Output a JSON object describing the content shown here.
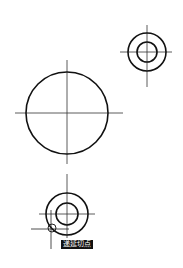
{
  "canvas": {
    "width": 183,
    "height": 268,
    "background": "#ffffff",
    "stroke": "#111111",
    "axis_stroke": "#333333"
  },
  "shapes": {
    "target_top_right": {
      "cx": 147,
      "cy": 52,
      "r_outer": 19,
      "r_inner": 10,
      "hx1": 120,
      "hx2": 172,
      "vy1": 25,
      "vy2": 87
    },
    "big_circle": {
      "cx": 67,
      "cy": 113,
      "r": 41,
      "hx1": 15,
      "hx2": 123,
      "vy1": 60,
      "vy2": 164
    },
    "target_bottom": {
      "cx": 67,
      "cy": 214,
      "r_outer": 21,
      "r_inner": 11,
      "hx1": 39,
      "hx2": 95,
      "vy1": 174,
      "vy2": 238
    },
    "cursor": {
      "x": 51,
      "y": 229,
      "hx1": 31,
      "hx2": 69,
      "vy1": 210,
      "vy2": 249,
      "marker_r": 4
    }
  },
  "tooltip": {
    "text": "递延切点",
    "x": 61,
    "y": 240
  }
}
